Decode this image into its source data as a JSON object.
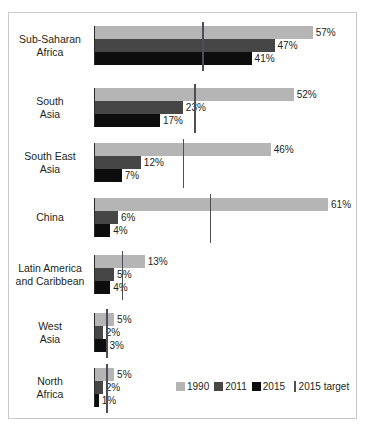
{
  "chart_data": {
    "type": "bar",
    "orientation": "horizontal",
    "title": "",
    "subtitle": "",
    "xlabel": "",
    "ylabel": "",
    "xlim": [
      0,
      65
    ],
    "grid": false,
    "legend_position": "bottom-right",
    "value_suffix": "%",
    "categories": [
      "Sub-Saharan Africa",
      "South Asia",
      "South East Asia",
      "China",
      "Latin America and Caribbean",
      "West Asia",
      "North Africa"
    ],
    "category_lines": [
      [
        "Sub-Saharan",
        "Africa"
      ],
      [
        "South",
        "Asia"
      ],
      [
        "South East",
        "Asia"
      ],
      [
        "China"
      ],
      [
        "Latin America",
        "and Caribbean"
      ],
      [
        "West",
        "Asia"
      ],
      [
        "North",
        "Africa"
      ]
    ],
    "series": [
      {
        "name": "1990",
        "color": "#b5b5b5",
        "values": [
          57,
          52,
          46,
          61,
          13,
          5,
          5
        ],
        "labels": [
          "57%",
          "52%",
          "46%",
          "61%",
          "13%",
          "5%",
          "5%"
        ]
      },
      {
        "name": "2011",
        "color": "#464646",
        "values": [
          47,
          23,
          12,
          6,
          5,
          2,
          2
        ],
        "labels": [
          "47%",
          "23%",
          "12%",
          "6%",
          "5%",
          "2%",
          "2%"
        ]
      },
      {
        "name": "2015",
        "color": "#0d0d0d",
        "values": [
          41,
          17,
          7,
          4,
          4,
          3,
          1
        ],
        "labels": [
          "41%",
          "17%",
          "7%",
          "4%",
          "4%",
          "3%",
          "1%"
        ]
      }
    ],
    "target_marker": {
      "name": "2015 target",
      "color": "#4e4e58",
      "values": [
        28,
        26,
        23,
        30,
        7,
        3,
        3
      ]
    }
  },
  "legend": {
    "items": [
      {
        "label": "1990",
        "swatch": "s0"
      },
      {
        "label": "2011",
        "swatch": "s1"
      },
      {
        "label": "2015",
        "swatch": "s2"
      }
    ],
    "target_label": "2015 target"
  },
  "colors": {
    "series_1990": "#b5b5b5",
    "series_2011": "#464646",
    "series_2015": "#0d0d0d",
    "target_rule": "#4e4e58",
    "axis": "#2b2b2b",
    "frame_border": "#c9c9c9",
    "text": "#231f20"
  }
}
